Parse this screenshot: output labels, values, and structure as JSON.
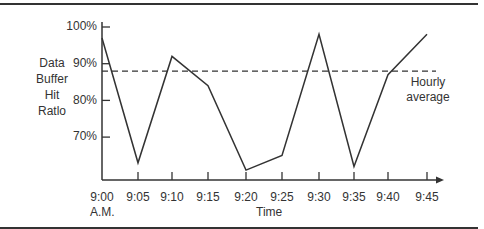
{
  "chart_data": {
    "type": "line",
    "title": "",
    "xlabel": "Time",
    "ylabel": "Data Buffer Hit Ratlo",
    "ylabel_lines": [
      "Data",
      "Buffer",
      "Hit",
      "Ratlo"
    ],
    "categories": [
      "9:00",
      "9:05",
      "9:10",
      "9:15",
      "9:20",
      "9:25",
      "9:30",
      "9:35",
      "9:40",
      "9:45"
    ],
    "x_sublabel": "A.M.",
    "series": [
      {
        "name": "Data Buffer Hit Ratio",
        "values": [
          97,
          63,
          92,
          84,
          61,
          65,
          98,
          62,
          87,
          98
        ]
      }
    ],
    "reference_lines": [
      {
        "name": "Hourly average",
        "value": 88,
        "style": "dashed"
      }
    ],
    "yticks": [
      "100%",
      "90%",
      "80%",
      "70%"
    ],
    "ytick_values": [
      100,
      90,
      80,
      70
    ],
    "ylim": [
      58,
      100
    ],
    "grid": false,
    "legend": "none",
    "annotations": [
      "Hourly average"
    ]
  },
  "labels": {
    "ylabel_lines": [
      "Data",
      "Buffer",
      "Hit",
      "Ratlo"
    ],
    "yticks": [
      "100%",
      "90%",
      "80%",
      "70%"
    ],
    "xticks": [
      "9:00",
      "9:05",
      "9:10",
      "9:15",
      "9:20",
      "9:25",
      "9:30",
      "9:35",
      "9:40",
      "9:45"
    ],
    "x_sublabel": "A.M.",
    "xlabel": "Time",
    "annotation_line1": "Hourly",
    "annotation_line2": "average"
  },
  "colors": {
    "line": "#333333",
    "axis": "#333333",
    "background": "#ffffff"
  }
}
